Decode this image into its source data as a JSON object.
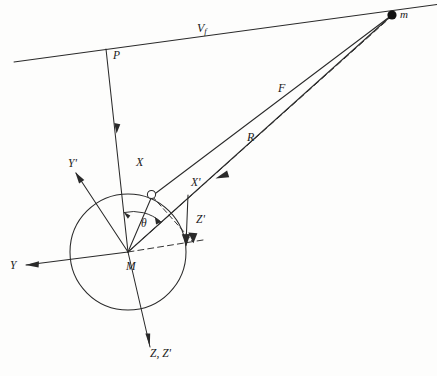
{
  "figure": {
    "type": "physics-vector-diagram",
    "title": "",
    "background_color": "#fdfdfc",
    "stroke_color": "#2a2a2a"
  },
  "labels": {
    "velocity": {
      "text": "V",
      "subscript": "f",
      "x": 197,
      "y": 22
    },
    "mass_point": {
      "text": "m",
      "x": 396,
      "y": 10
    },
    "point_p": {
      "text": "P",
      "x": 113,
      "y": 55
    },
    "force": {
      "text": "F",
      "x": 278,
      "y": 82
    },
    "range": {
      "text": "R",
      "x": 247,
      "y": 131
    },
    "axis_x": {
      "text": "X",
      "x": 136,
      "y": 156
    },
    "axis_y": {
      "text": "Y",
      "x": 10,
      "y": 261
    },
    "axis_y_prime": {
      "text": "Y'",
      "x": 68,
      "y": 160
    },
    "axis_x_prime": {
      "text": "X'",
      "x": 192,
      "y": 179
    },
    "axis_z_prime": {
      "text": "Z'",
      "x": 196,
      "y": 216
    },
    "axis_z_zprime": {
      "text": "Z, Z'",
      "x": 148,
      "y": 350
    },
    "center_m": {
      "text": "M",
      "x": 127,
      "y": 263
    },
    "theta": {
      "text": "θ",
      "x": 141,
      "y": 222
    }
  },
  "geometry": {
    "sphere": {
      "cx": 128,
      "cy": 252,
      "r": 58
    },
    "mass_point_marker": {
      "cx": 392,
      "cy": 15,
      "r": 4.6,
      "filled": true
    },
    "small_circle_marker": {
      "cx": 150,
      "cy": 194,
      "r": 4.0,
      "filled": false
    },
    "origin": {
      "x": 128,
      "y": 252
    },
    "trajectory_line": {
      "x1": 14,
      "y1": 62,
      "x2": 437,
      "y2": 5
    },
    "point_p": {
      "x": 106,
      "y": 49
    }
  },
  "elements": [
    "trajectory-line",
    "mass-point",
    "sphere-outline",
    "x-axis",
    "y-axis",
    "z-axis",
    "x-prime-axis",
    "y-prime-axis",
    "z-prime-axis",
    "force-vector",
    "range-vector",
    "dashed-projection-lines",
    "theta-arc"
  ]
}
